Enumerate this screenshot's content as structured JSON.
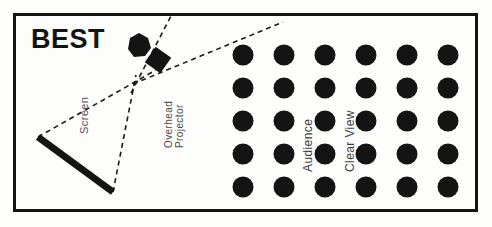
{
  "figure": {
    "title_word": "BEST",
    "background_color": "#fdfdfc",
    "ink_color": "#141414",
    "border": {
      "x": 13,
      "y": 13,
      "width": 465,
      "height": 199,
      "stroke_width": 3
    }
  },
  "labels": {
    "screen": "Screen",
    "overhead_line1": "Overhead",
    "overhead_line2": "Projector",
    "audience": "Audience",
    "clear_view": "Clear View"
  },
  "elements": {
    "screen_bar": {
      "x1": 38,
      "y1": 137,
      "x2": 113,
      "y2": 192,
      "stroke_width": 7,
      "color": "#141414"
    },
    "projector_body": {
      "cx": 139,
      "cy": 45,
      "r": 11,
      "color": "#141414"
    },
    "projector_head": {
      "cx": 158,
      "cy": 60,
      "size": 19,
      "rotation_deg": 35,
      "color": "#141414"
    }
  },
  "sight_lines": {
    "dash_pattern": "5,4",
    "stroke_width": 1.6,
    "color": "#1b1b1b",
    "lines": [
      {
        "name": "projector-up",
        "x1": 131,
        "y1": 93,
        "x2": 171,
        "y2": 16
      },
      {
        "name": "projector-to-audience",
        "x1": 133,
        "y1": 84,
        "x2": 283,
        "y2": 22
      },
      {
        "name": "screen-top-to-projector",
        "x1": 38,
        "y1": 137,
        "x2": 156,
        "y2": 70
      },
      {
        "name": "screen-bottom-to-projector",
        "x1": 113,
        "y1": 192,
        "x2": 136,
        "y2": 75
      }
    ]
  },
  "audience_grid": {
    "rows": 5,
    "cols": 6,
    "dot_radius": 10.5,
    "dot_color": "#141414",
    "origin_x": 243,
    "origin_y": 55,
    "step_x": 41,
    "step_y": 33
  }
}
